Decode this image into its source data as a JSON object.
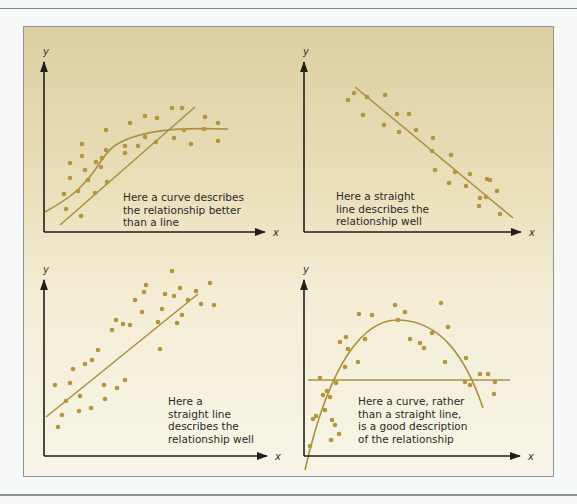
{
  "colors": {
    "point": "#b69438",
    "fit_line": "#a8923f",
    "axis": "#1e1e1e"
  },
  "panels": [
    {
      "id": "curve-better-than-line",
      "axis_labels": {
        "x": "x",
        "y": "y"
      },
      "caption": [
        "Here a curve describes",
        "the relationship better",
        "than a line"
      ],
      "origin": [
        44,
        232
      ],
      "y_top": 62,
      "x_end": 265,
      "caption_pos": [
        123,
        201
      ],
      "fits": [
        {
          "type": "line",
          "d": "M60,225 L195,107"
        },
        {
          "type": "curve",
          "d": "M45,212 C70,198 80,190 95,170 C108,150 112,145 130,138 C160,128 185,128 228,129"
        }
      ],
      "points": [
        [
          64,
          194
        ],
        [
          66,
          209
        ],
        [
          70,
          163
        ],
        [
          70,
          178
        ],
        [
          82,
          144
        ],
        [
          82,
          156
        ],
        [
          85,
          170
        ],
        [
          81,
          216
        ],
        [
          96,
          162
        ],
        [
          95,
          193
        ],
        [
          101,
          167
        ],
        [
          102,
          158
        ],
        [
          106,
          130
        ],
        [
          106,
          150
        ],
        [
          107,
          182
        ],
        [
          125,
          146
        ],
        [
          125,
          153
        ],
        [
          130,
          123
        ],
        [
          138,
          146
        ],
        [
          145,
          116
        ],
        [
          145,
          137
        ],
        [
          157,
          118
        ],
        [
          156,
          142
        ],
        [
          172,
          108
        ],
        [
          174,
          138
        ],
        [
          182,
          108
        ],
        [
          184,
          130
        ],
        [
          191,
          144
        ],
        [
          204,
          129
        ],
        [
          205,
          117
        ],
        [
          218,
          123
        ],
        [
          218,
          141
        ],
        [
          78,
          191
        ],
        [
          88,
          180
        ]
      ]
    },
    {
      "id": "straight-line-negative",
      "axis_labels": {
        "x": "x",
        "y": "y"
      },
      "caption": [
        "Here a straight",
        "line describes the",
        "relationship well"
      ],
      "origin": [
        304,
        232
      ],
      "y_top": 62,
      "x_end": 521,
      "caption_pos": [
        336,
        200
      ],
      "fits": [
        {
          "type": "line",
          "d": "M355,87 L513,218"
        }
      ],
      "points": [
        [
          348,
          100
        ],
        [
          354,
          93
        ],
        [
          367,
          97
        ],
        [
          363,
          115
        ],
        [
          385,
          95
        ],
        [
          384,
          125
        ],
        [
          397,
          114
        ],
        [
          399,
          132
        ],
        [
          409,
          114
        ],
        [
          416,
          130
        ],
        [
          433,
          138
        ],
        [
          432,
          151
        ],
        [
          435,
          170
        ],
        [
          451,
          155
        ],
        [
          449,
          183
        ],
        [
          455,
          172
        ],
        [
          470,
          174
        ],
        [
          466,
          186
        ],
        [
          487,
          179
        ],
        [
          479,
          206
        ],
        [
          490,
          180
        ],
        [
          486,
          197
        ],
        [
          500,
          214
        ],
        [
          497,
          191
        ],
        [
          480,
          198
        ]
      ]
    },
    {
      "id": "straight-line-positive",
      "axis_labels": {
        "x": "x",
        "y": "y"
      },
      "caption": [
        "Here a",
        "straight line",
        "describes the",
        "relationship well"
      ],
      "origin": [
        44,
        456
      ],
      "y_top": 280,
      "x_end": 267,
      "caption_pos": [
        168,
        405
      ],
      "fits": [
        {
          "type": "line",
          "d": "M46,417 L198,294"
        }
      ],
      "points": [
        [
          55,
          385
        ],
        [
          58,
          427
        ],
        [
          62,
          415
        ],
        [
          70,
          383
        ],
        [
          66,
          401
        ],
        [
          80,
          396
        ],
        [
          73,
          369
        ],
        [
          85,
          364
        ],
        [
          79,
          411
        ],
        [
          91,
          408
        ],
        [
          92,
          360
        ],
        [
          98,
          350
        ],
        [
          104,
          385
        ],
        [
          105,
          399
        ],
        [
          112,
          330
        ],
        [
          116,
          320
        ],
        [
          117,
          388
        ],
        [
          123,
          324
        ],
        [
          125,
          380
        ],
        [
          130,
          325
        ],
        [
          135,
          300
        ],
        [
          142,
          312
        ],
        [
          144,
          292
        ],
        [
          146,
          285
        ],
        [
          158,
          322
        ],
        [
          160,
          349
        ],
        [
          162,
          309
        ],
        [
          165,
          294
        ],
        [
          177,
          323
        ],
        [
          180,
          288
        ],
        [
          182,
          315
        ],
        [
          188,
          300
        ],
        [
          196,
          291
        ],
        [
          201,
          304
        ],
        [
          210,
          283
        ],
        [
          214,
          305
        ],
        [
          174,
          296
        ],
        [
          172,
          271
        ]
      ]
    },
    {
      "id": "curve-parabola",
      "axis_labels": {
        "x": "x",
        "y": "y"
      },
      "caption": [
        "Here a curve, rather",
        "than a straight line,",
        "is a good description",
        "of the relationship"
      ],
      "origin": [
        304,
        456
      ],
      "y_top": 280,
      "x_end": 520,
      "caption_pos": [
        358,
        405
      ],
      "fits": [
        {
          "type": "line",
          "d": "M308,380 L510,380"
        },
        {
          "type": "curve",
          "d": "M305,470 C330,360 365,318 400,320 C440,322 465,355 483,408"
        }
      ],
      "points": [
        [
          320,
          378
        ],
        [
          316,
          416
        ],
        [
          331,
          440
        ],
        [
          323,
          395
        ],
        [
          325,
          410
        ],
        [
          335,
          425
        ],
        [
          345,
          367
        ],
        [
          336,
          383
        ],
        [
          330,
          397
        ],
        [
          332,
          420
        ],
        [
          340,
          342
        ],
        [
          346,
          337
        ],
        [
          348,
          349
        ],
        [
          358,
          362
        ],
        [
          365,
          339
        ],
        [
          359,
          314
        ],
        [
          372,
          315
        ],
        [
          395,
          305
        ],
        [
          398,
          320
        ],
        [
          405,
          312
        ],
        [
          410,
          339
        ],
        [
          420,
          343
        ],
        [
          424,
          348
        ],
        [
          432,
          333
        ],
        [
          441,
          303
        ],
        [
          448,
          327
        ],
        [
          445,
          362
        ],
        [
          465,
          382
        ],
        [
          466,
          358
        ],
        [
          470,
          385
        ],
        [
          480,
          374
        ],
        [
          488,
          374
        ],
        [
          494,
          394
        ],
        [
          495,
          382
        ],
        [
          313,
          419
        ],
        [
          310,
          446
        ],
        [
          327,
          391
        ],
        [
          339,
          434
        ]
      ]
    }
  ]
}
